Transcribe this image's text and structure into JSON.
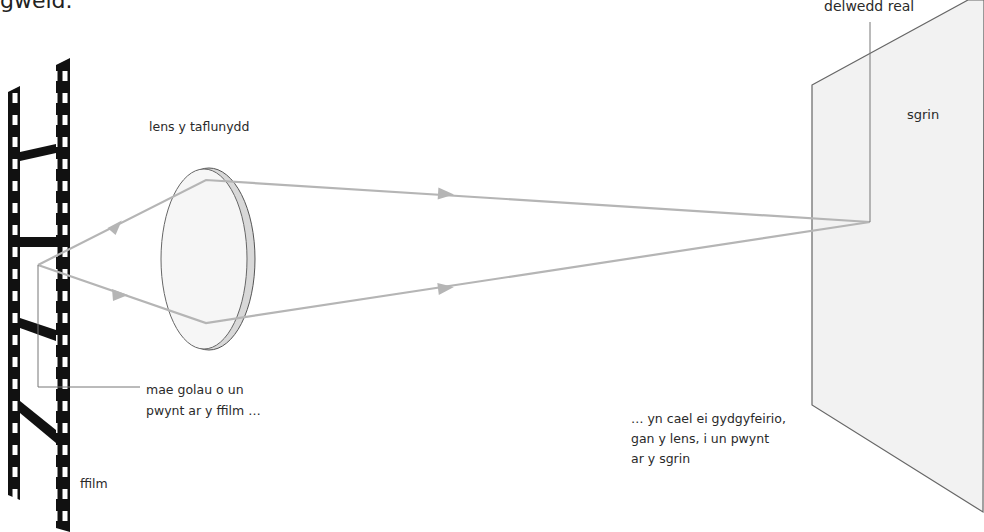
{
  "diagram": {
    "title_fragment": "gweld.",
    "colors": {
      "ray": "#b5b5b5",
      "film": "#111111",
      "screen_fill": "#f2f2f2",
      "screen_edge": "#666666",
      "lens_fill": "#f6f6f6",
      "lens_rim": "#cfcfcf",
      "leader_line": "#777777",
      "text": "#2a2a2a"
    },
    "labels": {
      "film": "ffilm",
      "lens": "lens y taflunydd",
      "screen": "sgrin",
      "real_image": "delwedd real",
      "source_point": "mae golau o un\npwynt ar y ffilm …",
      "image_point": "… yn cael ei gydgyfeirio,\ngan y lens, i un pwynt\nar y sgrin"
    }
  }
}
